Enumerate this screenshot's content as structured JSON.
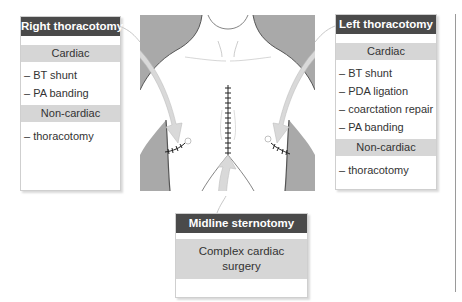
{
  "right_box": {
    "title": "Right thoracotomy",
    "sections": [
      {
        "header": "Cardiac",
        "items": [
          "– BT shunt",
          "– PA banding"
        ]
      },
      {
        "header": "Non-cardiac",
        "items": [
          "– thoracotomy"
        ]
      }
    ]
  },
  "left_box": {
    "title": "Left thoracotomy",
    "sections": [
      {
        "header": "Cardiac",
        "items": [
          "– BT shunt",
          "– PDA ligation",
          "– coarctation repair",
          "– PA banding"
        ]
      },
      {
        "header": "Non-cardiac",
        "items": [
          "– thoracotomy"
        ]
      }
    ]
  },
  "midline_box": {
    "title": "Midline sternotomy",
    "content": "Complex cardiac surgery"
  },
  "figure": {
    "incisions": [
      "right-thoracotomy-incision",
      "midline-sternotomy-incision",
      "left-thoracotomy-incision"
    ]
  },
  "colors": {
    "title_bg": "#4a4a4a",
    "band_bg": "#d6d6d6",
    "figure_shadow": "#a8a8a8",
    "arrow": "#cfcfcf"
  }
}
